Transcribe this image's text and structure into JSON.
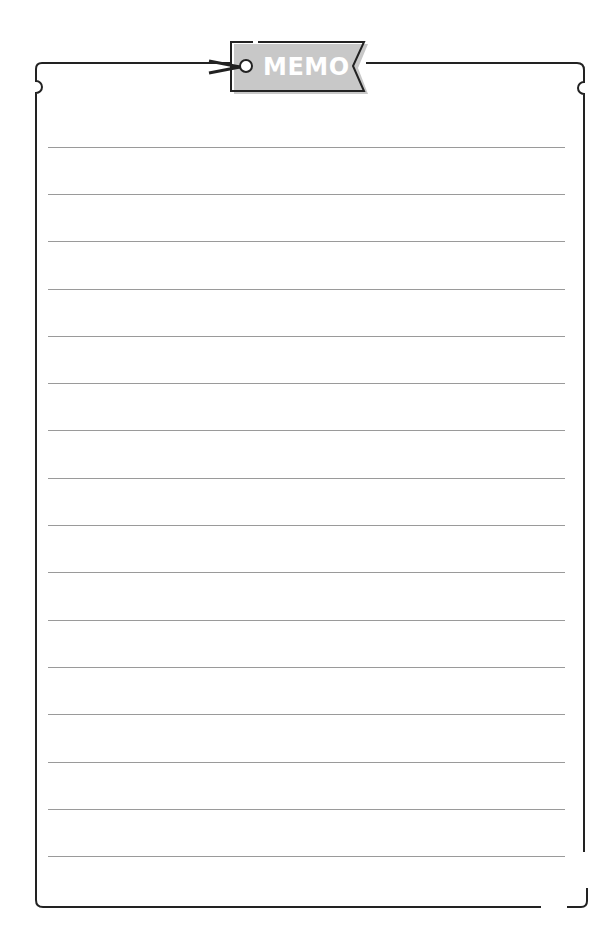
{
  "memo": {
    "tag_label": "MEMO",
    "line_count": 16,
    "line_positions_y": [
      147,
      194,
      241,
      289,
      336,
      383,
      430,
      478,
      525,
      572,
      620,
      667,
      714,
      762,
      809,
      856
    ]
  },
  "colors": {
    "border": "#222222",
    "tag_fill": "#c8c8c8",
    "tag_text": "#ffffff",
    "ruled_line": "#9a9a9a"
  }
}
